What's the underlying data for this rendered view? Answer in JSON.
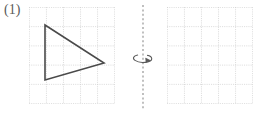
{
  "figure": {
    "label": "(1)",
    "kind": "rotation-about-vertical-axis-worksheet",
    "width": 260,
    "height": 115,
    "background_color": "#ffffff"
  },
  "grid": {
    "columns": 5,
    "rows": 5,
    "cell_size": 17.2,
    "line_color": "#cfcfcf",
    "line_width": 0.7,
    "line_style": "dotted",
    "panel_width": 86,
    "panel_height": 97
  },
  "left_panel": {
    "name": "original-figure-grid",
    "origin_x": 29,
    "origin_y": 7,
    "empty": false
  },
  "right_panel": {
    "name": "answer-figure-grid",
    "origin_x": 167,
    "origin_y": 7,
    "empty": true
  },
  "shape": {
    "name": "triangle",
    "type": "polygon",
    "stroke_color": "#4a4a4a",
    "stroke_width": 1.6,
    "fill": "none",
    "vertices": [
      {
        "label": "top-left",
        "x": 45,
        "y": 25
      },
      {
        "label": "right",
        "x": 104,
        "y": 63
      },
      {
        "label": "bottom-left",
        "x": 45,
        "y": 80
      }
    ]
  },
  "axis": {
    "name": "rotation-axis",
    "orientation": "vertical",
    "x": 143,
    "y_top": 5,
    "y_bottom": 110,
    "color": "#8c8c8c",
    "dash": "2,2.4",
    "stroke_width": 1.1
  },
  "rotation_arrow": {
    "name": "rotation-direction-arrow",
    "center_x": 143,
    "center_y": 58,
    "radius_x": 10,
    "radius_y": 4,
    "color": "#5a5a5a",
    "stroke_width": 1.1,
    "direction": "clockwise-from-above",
    "arrowhead_side": "right"
  }
}
